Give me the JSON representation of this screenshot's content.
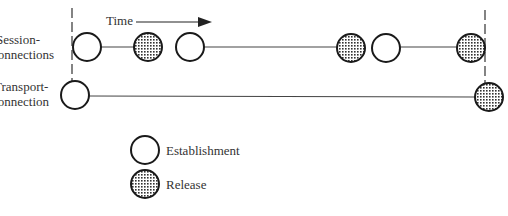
{
  "diagram": {
    "time_label": "Time",
    "rows": [
      {
        "label_line1": "Session-",
        "label_line2": "connections"
      },
      {
        "label_line1": "Transport-",
        "label_line2": "connection"
      }
    ],
    "legend": [
      {
        "symbol": "open-circle",
        "label": "Establishment"
      },
      {
        "symbol": "dotted-circle",
        "label": "Release"
      }
    ]
  },
  "session_events": [
    {
      "x": 87,
      "type": "establishment"
    },
    {
      "x": 148,
      "type": "release"
    },
    {
      "x": 190,
      "type": "establishment"
    },
    {
      "x": 351,
      "type": "release"
    },
    {
      "x": 386,
      "type": "establishment"
    },
    {
      "x": 471,
      "type": "release"
    }
  ],
  "transport_events": [
    {
      "x": 75,
      "type": "establishment"
    },
    {
      "x": 489,
      "type": "release"
    }
  ]
}
